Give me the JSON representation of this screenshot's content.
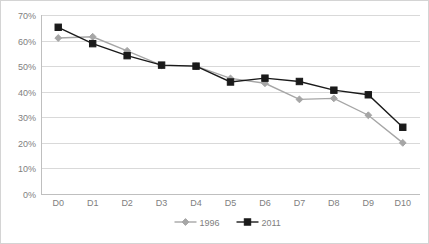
{
  "chart_data": {
    "type": "line",
    "title": "",
    "subtitle": "",
    "xlabel": "",
    "ylabel": "",
    "categories": [
      "D0",
      "D1",
      "D2",
      "D3",
      "D4",
      "D5",
      "D6",
      "D7",
      "D8",
      "D9",
      "D10"
    ],
    "ylim": [
      0,
      70
    ],
    "ytick_values": [
      0,
      10,
      20,
      30,
      40,
      50,
      60,
      70
    ],
    "ytick_labels": [
      "0%",
      "10%",
      "20%",
      "30%",
      "40%",
      "50%",
      "60%",
      "70%"
    ],
    "grid": true,
    "legend_position": "bottom",
    "series": [
      {
        "name": "1996",
        "color": "#a6a6a6",
        "marker": "diamond",
        "values": [
          61.0,
          61.5,
          56.0,
          50.3,
          50.0,
          45.2,
          43.3,
          37.0,
          37.4,
          30.8,
          20.0
        ]
      },
      {
        "name": "2011",
        "color": "#1a1a1a",
        "marker": "square",
        "values": [
          65.2,
          58.8,
          54.1,
          50.4,
          50.0,
          43.8,
          45.3,
          44.0,
          40.6,
          38.8,
          26.1
        ]
      }
    ]
  },
  "colors": {
    "frame_border": "#d4d4d4",
    "gridline": "#d9d9d9",
    "axis": "#bfbfbf",
    "tick_text": "#808080",
    "background": "#ffffff"
  }
}
